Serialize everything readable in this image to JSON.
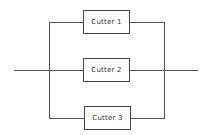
{
  "diagram": {
    "type": "parallel-system block diagram",
    "line_color": "#555555",
    "box_border_color": "#444444",
    "text_color": "#333333",
    "blocks": [
      {
        "id": "cutter-1",
        "label": "Cutter 1"
      },
      {
        "id": "cutter-2",
        "label": "Cutter 2"
      },
      {
        "id": "cutter-3",
        "label": "Cutter 3"
      }
    ],
    "connections": "input line splits into three parallel branches, each through a cutter, recombining into output line"
  }
}
